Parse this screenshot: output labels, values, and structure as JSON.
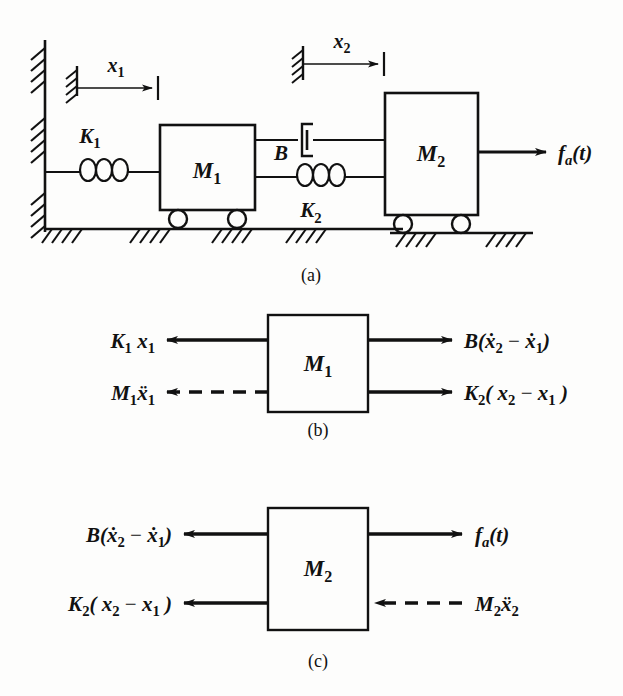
{
  "figure": {
    "background_color": "#fdfdfc",
    "line_color": "#111111",
    "panels": [
      {
        "id": "a",
        "caption": "(a)",
        "description": "Physical schematic of two-mass system"
      },
      {
        "id": "b",
        "caption": "(b)",
        "description": "Free-body diagram of mass M1"
      },
      {
        "id": "c",
        "caption": "(c)",
        "description": "Free-body diagram of mass M2"
      }
    ]
  },
  "schematic": {
    "caption": "(a)",
    "masses": [
      {
        "name": "mass-m1",
        "label": "M",
        "subscript": "1"
      },
      {
        "name": "mass-m2",
        "label": "M",
        "subscript": "2"
      }
    ],
    "springs": [
      {
        "name": "spring-k1",
        "label": "K",
        "subscript": "1",
        "connects": "wall-to-M1"
      },
      {
        "name": "spring-k2",
        "label": "K",
        "subscript": "2",
        "connects": "M1-to-M2"
      }
    ],
    "damper": {
      "name": "damper-b",
      "label": "B",
      "connects": "M1-to-M2"
    },
    "displacements": [
      {
        "name": "displacement-x1",
        "label": "x",
        "subscript": "1"
      },
      {
        "name": "displacement-x2",
        "label": "x",
        "subscript": "2"
      }
    ],
    "applied_force": {
      "label": "f",
      "subscript": "a",
      "argument": "(t)",
      "full": "fa(t)"
    }
  },
  "fbd_m1": {
    "caption": "(b)",
    "body": {
      "label": "M",
      "subscript": "1"
    },
    "forces": [
      {
        "name": "force-k1x1",
        "position": "top-left",
        "direction": "left",
        "style": "solid",
        "parts": [
          {
            "t": "K",
            "k": "i"
          },
          {
            "t": "1",
            "k": "sub"
          },
          {
            "t": " x",
            "k": "i"
          },
          {
            "t": "1",
            "k": "sub"
          }
        ]
      },
      {
        "name": "force-m1x1ddot",
        "position": "bottom-left",
        "direction": "left",
        "style": "dashed",
        "parts": [
          {
            "t": "M",
            "k": "i"
          },
          {
            "t": "1",
            "k": "sub"
          },
          {
            "t": "ẍ",
            "k": "i"
          },
          {
            "t": "1",
            "k": "sub"
          }
        ]
      },
      {
        "name": "force-bxdot-diff",
        "position": "top-right",
        "direction": "right",
        "style": "solid",
        "parts": [
          {
            "t": "B(",
            "k": "i"
          },
          {
            "t": "ẋ",
            "k": "i"
          },
          {
            "t": "2",
            "k": "sub"
          },
          {
            "t": " − ",
            "k": "n"
          },
          {
            "t": "ẋ",
            "k": "i"
          },
          {
            "t": "1",
            "k": "sub"
          },
          {
            "t": ")",
            "k": "i"
          }
        ]
      },
      {
        "name": "force-k2x-diff",
        "position": "bottom-right",
        "direction": "right",
        "style": "solid",
        "parts": [
          {
            "t": "K",
            "k": "i"
          },
          {
            "t": "2",
            "k": "sub"
          },
          {
            "t": "( x",
            "k": "i"
          },
          {
            "t": "2",
            "k": "sub"
          },
          {
            "t": " − ",
            "k": "n"
          },
          {
            "t": "x",
            "k": "i"
          },
          {
            "t": "1",
            "k": "sub"
          },
          {
            "t": " )",
            "k": "i"
          }
        ]
      }
    ]
  },
  "fbd_m2": {
    "caption": "(c)",
    "body": {
      "label": "M",
      "subscript": "2"
    },
    "forces": [
      {
        "name": "force-bxdot-diff-c",
        "position": "top-left",
        "direction": "left",
        "style": "solid",
        "parts": [
          {
            "t": "B(",
            "k": "i"
          },
          {
            "t": "ẋ",
            "k": "i"
          },
          {
            "t": "2",
            "k": "sub"
          },
          {
            "t": " − ",
            "k": "n"
          },
          {
            "t": "ẋ",
            "k": "i"
          },
          {
            "t": "1",
            "k": "sub"
          },
          {
            "t": ")",
            "k": "i"
          }
        ]
      },
      {
        "name": "force-k2x-diff-c",
        "position": "bottom-left",
        "direction": "left",
        "style": "solid",
        "parts": [
          {
            "t": "K",
            "k": "i"
          },
          {
            "t": "2",
            "k": "sub"
          },
          {
            "t": "( x",
            "k": "i"
          },
          {
            "t": "2",
            "k": "sub"
          },
          {
            "t": " − ",
            "k": "n"
          },
          {
            "t": "x",
            "k": "i"
          },
          {
            "t": "1",
            "k": "sub"
          },
          {
            "t": " )",
            "k": "i"
          }
        ]
      },
      {
        "name": "force-fa",
        "position": "top-right",
        "direction": "right",
        "style": "solid",
        "parts": [
          {
            "t": "f",
            "k": "i"
          },
          {
            "t": "a",
            "k": "subi"
          },
          {
            "t": "(t)",
            "k": "i"
          }
        ]
      },
      {
        "name": "force-m2x2ddot",
        "position": "bottom-right",
        "direction": "left",
        "style": "dashed",
        "parts": [
          {
            "t": "M",
            "k": "i"
          },
          {
            "t": "2",
            "k": "sub"
          },
          {
            "t": "ẍ",
            "k": "i"
          },
          {
            "t": "2",
            "k": "sub"
          }
        ]
      }
    ]
  }
}
